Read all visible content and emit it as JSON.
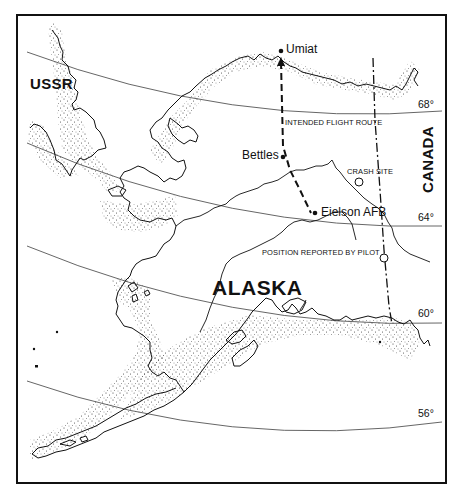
{
  "map": {
    "title": "",
    "region_labels": {
      "ussr": "USSR",
      "alaska": "ALASKA",
      "canada": "CANADA"
    },
    "places": [
      {
        "name": "Umiat",
        "x": 277,
        "y": 71
      },
      {
        "name": "Bettles",
        "x": 283,
        "y": 156
      },
      {
        "name": "Eielson AFB",
        "x": 316,
        "y": 212
      }
    ],
    "annotations": {
      "intended_route": "INTENDED FLIGHT ROUTE",
      "crash_site": "CRASH SITE",
      "reported_position": "POSITION REPORTED BY PILOT"
    },
    "latitudes": [
      {
        "label": "68°",
        "x": 418,
        "y": 110
      },
      {
        "label": "64°",
        "x": 418,
        "y": 220
      },
      {
        "label": "60°",
        "x": 418,
        "y": 316
      },
      {
        "label": "56°",
        "x": 418,
        "y": 414
      }
    ],
    "colors": {
      "ink": "#111111",
      "background": "#ffffff",
      "graticule": "#555555"
    }
  }
}
